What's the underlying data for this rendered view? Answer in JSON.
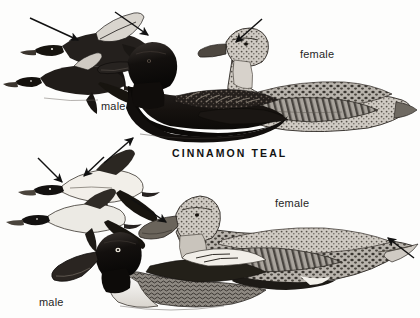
{
  "plate": {
    "width": 420,
    "height": 318,
    "background_color": "#fdfdfc",
    "ink_color": "#1d1d1d",
    "medium": "grayscale field-guide illustration"
  },
  "species_caption": {
    "text": "CINNAMON TEAL",
    "x": 172,
    "y": 148
  },
  "labels": [
    {
      "id": "teal-male",
      "text": "male",
      "x": 101,
      "y": 101,
      "for": "cinnamon-teal-male"
    },
    {
      "id": "teal-female",
      "text": "female",
      "x": 300,
      "y": 49,
      "for": "cinnamon-teal-female"
    },
    {
      "id": "shoveler-female",
      "text": "female",
      "x": 275,
      "y": 198,
      "for": "northern-shoveler-female"
    },
    {
      "id": "shoveler-male",
      "text": "male",
      "x": 39,
      "y": 297,
      "for": "northern-shoveler-male"
    }
  ],
  "arrows": [
    {
      "id": "arrow-flying-teal-head",
      "x1": 30,
      "y1": 18,
      "x2": 78,
      "y2": 40,
      "points_to": "flying teal head"
    },
    {
      "id": "arrow-flying-teal-wing",
      "x1": 115,
      "y1": 12,
      "x2": 148,
      "y2": 35,
      "points_to": "flying teal wing patch"
    },
    {
      "id": "arrow-teal-female-face",
      "x1": 262,
      "y1": 19,
      "x2": 236,
      "y2": 42,
      "points_to": "female teal face"
    },
    {
      "id": "arrow-teal-male-flank",
      "x1": 104,
      "y1": 163,
      "x2": 133,
      "y2": 138,
      "points_to": "male teal flank"
    },
    {
      "id": "arrow-flying-shoveler-wing",
      "x1": 38,
      "y1": 158,
      "x2": 62,
      "y2": 182,
      "points_to": "flying shoveler wing"
    },
    {
      "id": "arrow-flying-shoveler-two",
      "x1": 104,
      "y1": 157,
      "x2": 84,
      "y2": 176,
      "points_to": "flying shoveler underside"
    },
    {
      "id": "arrow-shoveler-female-bill",
      "x1": 130,
      "y1": 198,
      "x2": 166,
      "y2": 222,
      "points_to": "female shoveler bill"
    },
    {
      "id": "arrow-shoveler-female-tail",
      "x1": 414,
      "y1": 258,
      "x2": 388,
      "y2": 238,
      "points_to": "female shoveler tail"
    }
  ],
  "figures": [
    {
      "id": "flying-teal-pair",
      "name": "flying cinnamon teal pair",
      "x": 8,
      "y": 8,
      "width": 95,
      "height": 80
    },
    {
      "id": "cinnamon-teal-male",
      "name": "swimming male cinnamon teal",
      "x": 105,
      "y": 52,
      "width": 175,
      "height": 95
    },
    {
      "id": "cinnamon-teal-female",
      "name": "swimming female cinnamon teal",
      "x": 205,
      "y": 30,
      "width": 200,
      "height": 105
    },
    {
      "id": "flying-shoveler-pair",
      "name": "flying northern shoveler pair",
      "x": 8,
      "y": 150,
      "width": 110,
      "height": 90
    },
    {
      "id": "northern-shoveler-male",
      "name": "swimming male northern shoveler",
      "x": 40,
      "y": 232,
      "width": 185,
      "height": 80
    },
    {
      "id": "northern-shoveler-female",
      "name": "swimming female northern shoveler",
      "x": 140,
      "y": 196,
      "width": 275,
      "height": 100
    }
  ]
}
